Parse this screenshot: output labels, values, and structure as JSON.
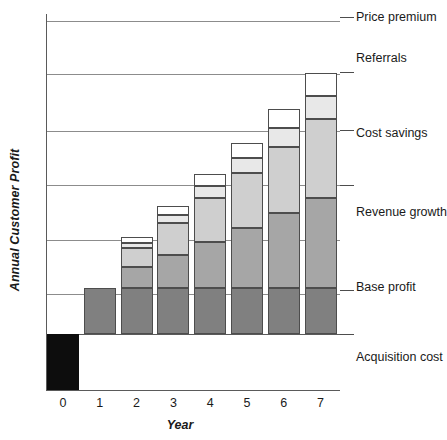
{
  "chart_data": {
    "type": "bar",
    "subtype": "stacked-bar",
    "title": "",
    "xlabel": "Year",
    "ylabel": "Annual Customer Profit",
    "categories": [
      "0",
      "1",
      "2",
      "3",
      "4",
      "5",
      "6",
      "7"
    ],
    "grid": true,
    "legend_position": "right-inline-labels",
    "ylim": [
      -1,
      7
    ],
    "y_tick_labels": [],
    "series": [
      {
        "name": "Acquisition cost",
        "color": "#0d0d0d",
        "values": [
          -1,
          0,
          0,
          0,
          0,
          0,
          0,
          0
        ]
      },
      {
        "name": "Base profit",
        "color": "#808080",
        "values": [
          0,
          1,
          1,
          1,
          1,
          1,
          1,
          1
        ]
      },
      {
        "name": "Revenue growth",
        "color": "#a6a6a6",
        "values": [
          0,
          0,
          0.45,
          0.72,
          1.0,
          1.3,
          1.62,
          1.95
        ]
      },
      {
        "name": "Cost savings",
        "color": "#cfcfcf",
        "values": [
          0,
          0,
          0.43,
          0.7,
          0.95,
          1.2,
          1.45,
          1.72
        ]
      },
      {
        "name": "Referrals",
        "color": "#e8e8e8",
        "values": [
          0,
          0,
          0.1,
          0.17,
          0.26,
          0.33,
          0.4,
          0.5
        ]
      },
      {
        "name": "Price premium",
        "color": "#ffffff",
        "values": [
          0,
          0,
          0.12,
          0.2,
          0.26,
          0.33,
          0.42,
          0.5
        ]
      }
    ],
    "gridlines_y": [
      21,
      74,
      131,
      185,
      240,
      294
    ],
    "zero_line_y": 334,
    "annotations": [
      "Price premium",
      "Referrals",
      "Cost savings",
      "Revenue growth",
      "Base profit",
      "Acquisition cost"
    ]
  },
  "series_labels": [
    {
      "text": "Price premium",
      "top": 10,
      "tick": 17
    },
    {
      "text": "Referrals",
      "top": 51,
      "tick": 72
    },
    {
      "text": "Cost savings",
      "top": 126,
      "tick": 130
    },
    {
      "text": "Revenue growth",
      "top": 205,
      "tick": 185
    },
    {
      "text": "Base profit",
      "top": 280,
      "tick": 290
    },
    {
      "text": "Acquisition cost",
      "top": 350,
      "tick": 334
    }
  ],
  "axis": {
    "y_title": "Annual Customer Profit",
    "x_title": "Year"
  },
  "colors": {
    "acquisition_cost": "#0d0d0d",
    "base_profit": "#808080",
    "revenue_growth": "#a6a6a6",
    "cost_savings": "#cfcfcf",
    "referrals": "#e8e8e8",
    "price_premium": "#ffffff",
    "gridline": "#8c8c8c",
    "axis": "#5a5a5a",
    "text": "#1a1a1a"
  }
}
